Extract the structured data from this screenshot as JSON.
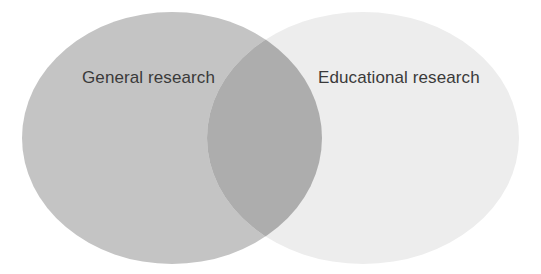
{
  "diagram": {
    "type": "venn",
    "background_color": "#ffffff",
    "sets": [
      {
        "id": "left",
        "label": "General research",
        "fill_color": "#c4c4c4",
        "center_x": 172,
        "center_y": 138,
        "radius_x": 150,
        "radius_y": 126
      },
      {
        "id": "right",
        "label": "Educational research",
        "fill_color": "#ededed",
        "center_x": 363,
        "center_y": 138,
        "radius_x": 156,
        "radius_y": 126
      }
    ],
    "intersection": {
      "id": "overlap",
      "label": "",
      "fill_color": "#adadad",
      "left_x": 207,
      "right_x": 322,
      "top_y": 33,
      "bottom_y": 253
    },
    "label_color": "#3a3a3a"
  }
}
